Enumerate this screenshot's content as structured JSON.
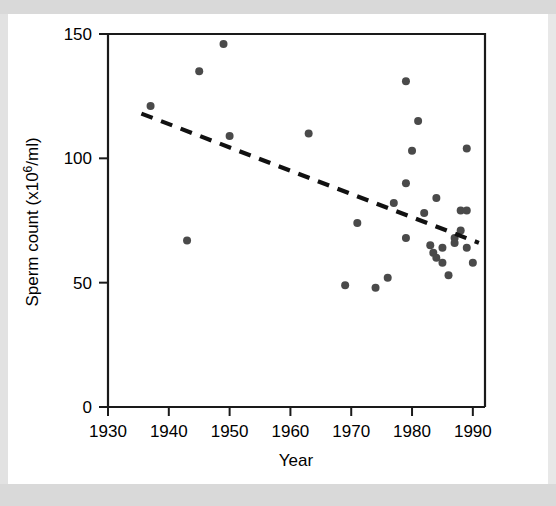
{
  "figure": {
    "background_color": "#ffffff",
    "point_color": "#4a4a4a",
    "axis_color": "#1a1a1a",
    "trendline_color": "#111111"
  },
  "chart_data": {
    "type": "scatter",
    "title": "",
    "xlabel": "Year",
    "ylabel": "Sperm count (x10⁶/ml)",
    "ylabel_parts": {
      "pre": "Sperm count (x10",
      "sup": "6",
      "post": "/ml)"
    },
    "xlim": [
      1930,
      1992
    ],
    "ylim": [
      0,
      150
    ],
    "xticks": [
      1930,
      1940,
      1950,
      1960,
      1970,
      1980,
      1990
    ],
    "xticklabels": [
      "1930",
      "1940",
      "1950",
      "1960",
      "1970",
      "1980",
      "1990"
    ],
    "yticks": [
      0,
      50,
      100,
      150
    ],
    "yticklabels": [
      "0",
      "50",
      "100",
      "150"
    ],
    "grid": false,
    "legend": false,
    "marker": "circle",
    "marker_size": 8,
    "points": [
      {
        "x": 1937,
        "y": 121
      },
      {
        "x": 1943,
        "y": 67
      },
      {
        "x": 1945,
        "y": 135
      },
      {
        "x": 1949,
        "y": 146
      },
      {
        "x": 1950,
        "y": 109
      },
      {
        "x": 1963,
        "y": 110
      },
      {
        "x": 1969,
        "y": 49
      },
      {
        "x": 1971,
        "y": 74
      },
      {
        "x": 1974,
        "y": 48
      },
      {
        "x": 1976,
        "y": 52
      },
      {
        "x": 1977,
        "y": 82
      },
      {
        "x": 1979,
        "y": 131
      },
      {
        "x": 1979,
        "y": 90
      },
      {
        "x": 1979,
        "y": 68
      },
      {
        "x": 1980,
        "y": 103
      },
      {
        "x": 1981,
        "y": 115
      },
      {
        "x": 1982,
        "y": 78
      },
      {
        "x": 1983,
        "y": 65
      },
      {
        "x": 1983.5,
        "y": 62
      },
      {
        "x": 1984,
        "y": 84
      },
      {
        "x": 1984,
        "y": 60
      },
      {
        "x": 1985,
        "y": 64
      },
      {
        "x": 1985,
        "y": 58
      },
      {
        "x": 1986,
        "y": 53
      },
      {
        "x": 1987,
        "y": 68
      },
      {
        "x": 1987,
        "y": 66
      },
      {
        "x": 1988,
        "y": 71
      },
      {
        "x": 1988,
        "y": 79
      },
      {
        "x": 1989,
        "y": 79
      },
      {
        "x": 1989,
        "y": 104
      },
      {
        "x": 1989,
        "y": 64
      },
      {
        "x": 1990,
        "y": 58
      }
    ],
    "trendline": {
      "style": "dashed",
      "x_start": 1935.5,
      "y_start": 118,
      "x_end": 1991,
      "y_end": 66
    }
  }
}
